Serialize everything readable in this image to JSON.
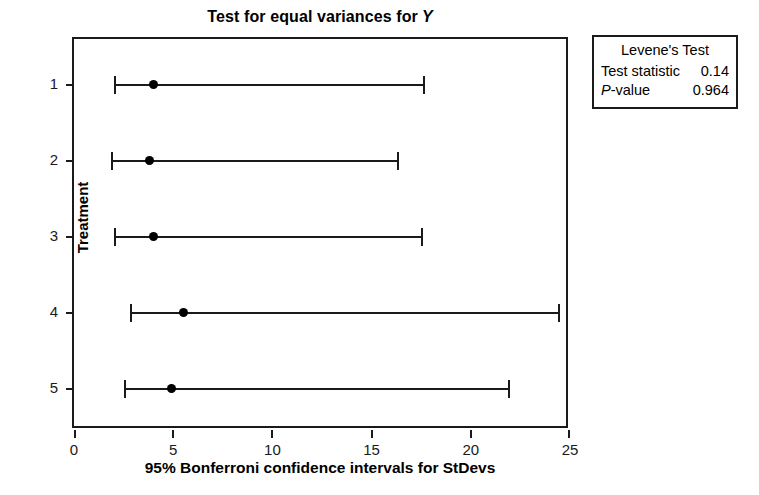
{
  "chart_data": {
    "type": "scatter",
    "title": "Test for equal variances for",
    "title_variable": "Y",
    "xlabel": "95% Bonferroni confidence intervals for StDevs",
    "ylabel": "Treatment",
    "xlim": [
      0,
      25
    ],
    "xticks": [
      "0",
      "5",
      "10",
      "15",
      "20",
      "25"
    ],
    "xtick_values": [
      0,
      5,
      10,
      15,
      20,
      25
    ],
    "yticks": [
      "1",
      "2",
      "3",
      "4",
      "5"
    ],
    "grid": false,
    "legend_position": "outside-right-top",
    "categories": [
      "1",
      "2",
      "3",
      "4",
      "5"
    ],
    "series": [
      {
        "name": "StDev point estimate",
        "values": [
          4.0,
          3.8,
          4.0,
          5.5,
          4.9
        ]
      },
      {
        "name": "CI lower bound",
        "values": [
          2.0,
          1.85,
          2.0,
          2.8,
          2.5
        ]
      },
      {
        "name": "CI upper bound",
        "values": [
          17.7,
          16.4,
          17.6,
          24.5,
          22.0
        ]
      }
    ],
    "intervals": [
      {
        "treatment": "1",
        "lower": 2.0,
        "point": 4.0,
        "upper": 17.7
      },
      {
        "treatment": "2",
        "lower": 1.85,
        "point": 3.8,
        "upper": 16.4
      },
      {
        "treatment": "3",
        "lower": 2.0,
        "point": 4.0,
        "upper": 17.6
      },
      {
        "treatment": "4",
        "lower": 2.8,
        "point": 5.5,
        "upper": 24.5
      },
      {
        "treatment": "5",
        "lower": 2.5,
        "point": 4.9,
        "upper": 22.0
      }
    ]
  },
  "legend": {
    "title": "Levene's Test",
    "rows": [
      {
        "label": "Test statistic",
        "value": "0.14",
        "italic_first": false
      },
      {
        "label": "-value",
        "value": "0.964",
        "italic_first": true,
        "italic_text": "P"
      }
    ]
  },
  "colors": {
    "line": "#1a1a1a",
    "marker": "#000000",
    "background": "#ffffff",
    "text": "#000000"
  }
}
